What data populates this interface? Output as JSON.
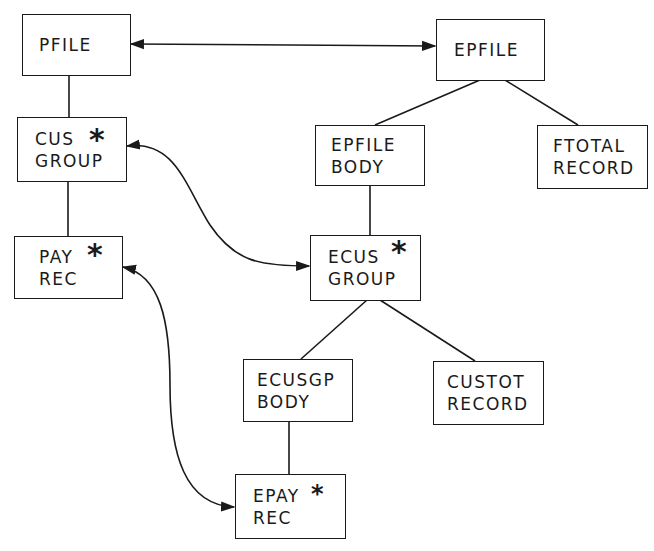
{
  "diagram": {
    "title": "",
    "nodes": {
      "pfile": {
        "lines": [
          "PFILE"
        ],
        "repeated": false
      },
      "epfile": {
        "lines": [
          "EPFILE"
        ],
        "repeated": false
      },
      "cus_group": {
        "lines": [
          "CUS",
          "GROUP"
        ],
        "repeated": true
      },
      "epfile_body": {
        "lines": [
          "EPFILE",
          "BODY"
        ],
        "repeated": false
      },
      "ftotal_record": {
        "lines": [
          "FTOTAL",
          "RECORD"
        ],
        "repeated": false
      },
      "pay_rec": {
        "lines": [
          "PAY",
          "REC"
        ],
        "repeated": true
      },
      "ecus_group": {
        "lines": [
          "ECUS",
          "GROUP"
        ],
        "repeated": true
      },
      "ecusgp_body": {
        "lines": [
          "ECUSGP",
          "BODY"
        ],
        "repeated": false
      },
      "custot_record": {
        "lines": [
          "CUSTOT",
          "RECORD"
        ],
        "repeated": false
      },
      "epay_rec": {
        "lines": [
          "EPAY",
          "REC"
        ],
        "repeated": true
      }
    },
    "repeat_marker": "*",
    "hierarchy_edges": [
      [
        "pfile",
        "cus_group"
      ],
      [
        "cus_group",
        "pay_rec"
      ],
      [
        "epfile",
        "epfile_body"
      ],
      [
        "epfile",
        "ftotal_record"
      ],
      [
        "epfile_body",
        "ecus_group"
      ],
      [
        "ecus_group",
        "ecusgp_body"
      ],
      [
        "ecus_group",
        "custot_record"
      ],
      [
        "ecusgp_body",
        "epay_rec"
      ]
    ],
    "correspondence_edges": [
      [
        "pfile",
        "epfile"
      ],
      [
        "cus_group",
        "ecus_group"
      ],
      [
        "pay_rec",
        "epay_rec"
      ]
    ],
    "colors": {
      "ink": "#1a1a1a",
      "background": "#ffffff"
    }
  }
}
